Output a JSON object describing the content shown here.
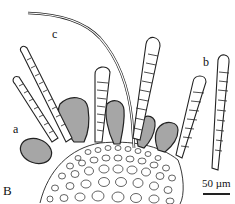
{
  "figure": {
    "panel_label": "B",
    "labels": {
      "a": "a",
      "b": "b",
      "c": "c"
    },
    "scale_bar": {
      "text": "50 µm"
    },
    "colors": {
      "ink": "#111111",
      "background": "#ffffff"
    }
  }
}
